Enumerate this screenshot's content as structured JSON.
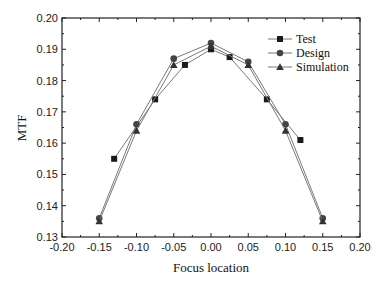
{
  "chart_data": {
    "type": "line",
    "title": "",
    "xlabel": "Focus location",
    "ylabel": "MTF",
    "xlim": [
      -0.2,
      0.2
    ],
    "ylim": [
      0.13,
      0.2
    ],
    "xticks": [
      "-0.20",
      "-0.15",
      "-0.10",
      "-0.05",
      "0.00",
      "0.05",
      "0.10",
      "0.15",
      "0.20"
    ],
    "yticks": [
      "0.13",
      "0.14",
      "0.15",
      "0.16",
      "0.17",
      "0.18",
      "0.19",
      "0.20"
    ],
    "grid": false,
    "legend_position": "upper right",
    "series": [
      {
        "name": "Test",
        "marker": "square",
        "x": [
          -0.13,
          -0.075,
          -0.035,
          0.0,
          0.025,
          0.075,
          0.12
        ],
        "values": [
          0.155,
          0.174,
          0.185,
          0.19,
          0.1875,
          0.174,
          0.161
        ]
      },
      {
        "name": "Design",
        "marker": "circle",
        "x": [
          -0.15,
          -0.1,
          -0.05,
          0.0,
          0.05,
          0.1,
          0.15
        ],
        "values": [
          0.136,
          0.166,
          0.187,
          0.192,
          0.186,
          0.166,
          0.136
        ]
      },
      {
        "name": "Simulation",
        "marker": "triangle",
        "x": [
          -0.15,
          -0.1,
          -0.05,
          0.0,
          0.05,
          0.1,
          0.15
        ],
        "values": [
          0.135,
          0.164,
          0.185,
          0.191,
          0.185,
          0.164,
          0.135
        ]
      }
    ]
  },
  "colors": {
    "line": "#7a7a7a",
    "marker": "#1a1a1a",
    "axis": "#222222"
  }
}
